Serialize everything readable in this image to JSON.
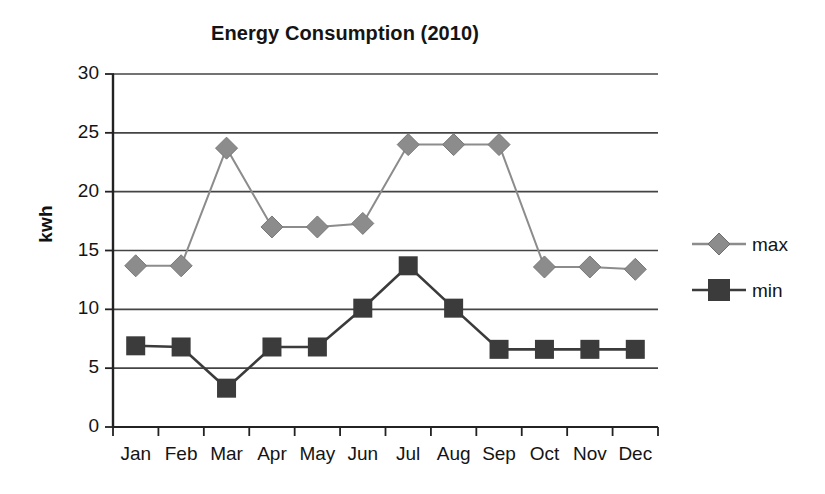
{
  "chart_data": {
    "type": "line",
    "title": "Energy Consumption (2010)",
    "xlabel": "",
    "ylabel": "kwh",
    "categories": [
      "Jan",
      "Feb",
      "Mar",
      "Apr",
      "May",
      "Jun",
      "Jul",
      "Aug",
      "Sep",
      "Oct",
      "Nov",
      "Dec"
    ],
    "series": [
      {
        "name": "max",
        "color": "#8c8c8c",
        "marker": "diamond",
        "values": [
          13.7,
          13.7,
          23.7,
          17.0,
          17.0,
          17.3,
          24.0,
          24.0,
          24.0,
          13.6,
          13.6,
          13.4
        ]
      },
      {
        "name": "min",
        "color": "#3b3b3b",
        "marker": "square",
        "values": [
          6.9,
          6.8,
          3.3,
          6.8,
          6.8,
          10.1,
          13.7,
          10.1,
          6.6,
          6.6,
          6.6,
          6.6
        ]
      }
    ],
    "ylim": [
      0,
      30
    ],
    "yticks": [
      0,
      5,
      10,
      15,
      20,
      25,
      30
    ],
    "ytick_labels": [
      "0",
      "5",
      "10",
      "15",
      "20",
      "25",
      "30"
    ],
    "grid": true,
    "grid_axis": "y",
    "legend_position": "right",
    "axis_color": "#222222",
    "grid_color": "#444444"
  },
  "legend": {
    "entries": [
      {
        "label": "max"
      },
      {
        "label": "min"
      }
    ]
  }
}
